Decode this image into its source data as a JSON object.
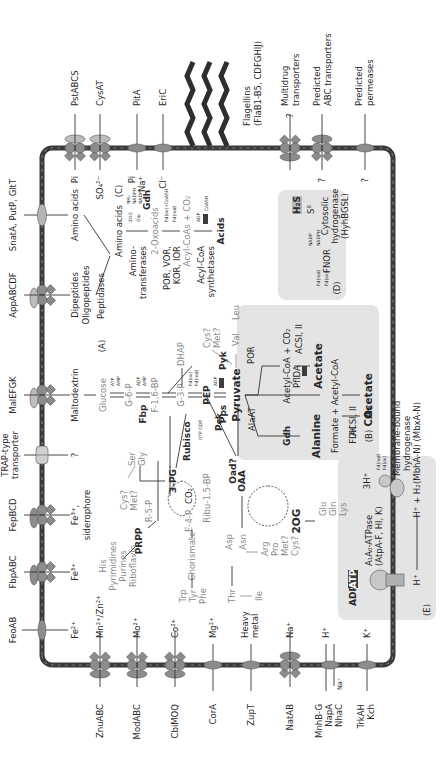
{
  "figure": {
    "orientation": "rotated-90-ccw",
    "membrane_color": "#3a3a3a",
    "box_color": "#e4e4e4",
    "transporter_color": "#8c8c8c"
  },
  "transporters_top": [
    {
      "name": "FeoAB",
      "substrate": "Fe2+",
      "type": "permease"
    },
    {
      "name": "FbpABC",
      "substrate": "Fe3+",
      "type": "abc"
    },
    {
      "name": "FepBCD",
      "substrate": "Fe3+, siderophore",
      "type": "abc"
    },
    {
      "name": "TRAP-type transporter",
      "substrate": "?",
      "type": "trap"
    },
    {
      "name": "MalEFGK",
      "substrate": "Maltodextrin",
      "type": "abc"
    },
    {
      "name": "AppABCDF",
      "substrate": "Dipeptides Oligopeptides",
      "type": "abc"
    },
    {
      "name": "SnatA, PutP, GltT",
      "substrate": "Amino acids",
      "type": "permease"
    }
  ],
  "transporters_right": [
    {
      "name": "PstABCS",
      "substrate": "Pi",
      "type": "abc"
    },
    {
      "name": "CysAT",
      "substrate": "SO4 2-",
      "type": "abc"
    },
    {
      "name": "PitA",
      "substrate": "Pi Na+",
      "type": "permease"
    },
    {
      "name": "EriC",
      "substrate": "Cl-",
      "type": "permease"
    },
    {
      "name": "Flagellins (FlaB1-B5, CDFGHIJ)",
      "type": "flagella"
    },
    {
      "name": "Multidrug transporters",
      "substrate": "?",
      "type": "abc"
    },
    {
      "name": "Predicted ABC transporters",
      "substrate": "?",
      "type": "abc"
    },
    {
      "name": "Predicted permeases",
      "substrate": "?",
      "type": "permease"
    }
  ],
  "transporters_bottom": [
    {
      "name": "ZnuABC",
      "substrate": "Mn2+/Zn2+",
      "type": "abc"
    },
    {
      "name": "ModABC",
      "substrate": "Mo2+",
      "type": "abc"
    },
    {
      "name": "CbiMOQ",
      "substrate": "Co2+",
      "type": "abc"
    },
    {
      "name": "CorA",
      "substrate": "Mg2+",
      "type": "permease"
    },
    {
      "name": "ZupT",
      "substrate": "Heavy metal",
      "type": "permease"
    },
    {
      "name": "NatAB",
      "substrate": "Na+",
      "type": "abc"
    },
    {
      "name": "MnhB-G NapA NhaC",
      "substrate": "H+ / Na+",
      "type": "antiporter"
    },
    {
      "name": "TrkAH Kch",
      "substrate": "K+",
      "type": "permease"
    }
  ],
  "labels": {
    "feoab": "FeoAB",
    "fbpabc": "FbpABC",
    "fepbcd": "FepBCD",
    "trap1": "TRAP-type",
    "trap2": "transporter",
    "malefgk": "MalEFGK",
    "appabcdf": "AppABCDF",
    "snata": "SnatA, PutP, GltT",
    "fe2": "Fe²⁺",
    "fe3a": "Fe³⁺",
    "fe3b": "Fe³⁺,",
    "siderophore": "siderophore",
    "q": "?",
    "maltodextrin": "Maltodextrin",
    "dipeptides": "Dipeptides",
    "oligopeptides": "Oligopeptides",
    "aminoacids_in": "Amino acids",
    "pstabcs": "PstABCS",
    "cysat": "CysAT",
    "pita": "PitA",
    "eric": "EriC",
    "flag1": "Flagellins",
    "flag2": "(FlaB1-B5, CDFGHIJ)",
    "multi1": "Multidrug",
    "multi2": "transporters",
    "predabc1": "Predicted",
    "predabc2": "ABC transporters",
    "predperm1": "Predicted",
    "predperm2": "permeases",
    "pi": "Pi",
    "so4": "SO₄²⁻",
    "pi2": "Pi",
    "na": "Na⁺",
    "cl": "Cl⁻",
    "znuabc": "ZnuABC",
    "modabc": "ModABC",
    "cbimoq": "CbiMOQ",
    "cora": "CorA",
    "zupt": "ZupT",
    "natab": "NatAB",
    "mnh1": "MnhB-G",
    "mnh2": "NapA",
    "mnh3": "NhaC",
    "trk1": "TrkAH",
    "trk2": "Kch",
    "mnzn": "Mn²⁺/Zn²⁺",
    "mo": "Mo²⁺",
    "co": "Co²⁺",
    "mg": "Mg²⁺",
    "heavy1": "Heavy",
    "heavy2": "metal",
    "na2": "Na⁺",
    "h": "H⁺",
    "na3": "Na⁺",
    "k": "K⁺",
    "secA": "(A)",
    "secB": "(B)",
    "secC": "(C)",
    "secD": "(D)",
    "secE": "(E)",
    "glucose": "Glucose",
    "g6p": "G-6-P",
    "fbp": "Fbp",
    "f16bp": "F-1,6-BP",
    "g3p": "G-3-P",
    "dhap": "DHAP",
    "pep": "PEP",
    "pps": "Pps",
    "pyk": "Pyk",
    "pyruvate": "Pyruvate",
    "pck": "Pck",
    "gtpgdp": "GTP GDP",
    "atp_s": "ATP",
    "adp_s": "ADP",
    "amp_s": "AMP",
    "fdox": "Fd(ox)",
    "fdred": "Fd(red)",
    "pg3": "3-PG",
    "rubisco": "Rubisco",
    "co2": "CO₂",
    "ribu": "Ribu-1,5-BP",
    "r5p": "R-5-P",
    "e4p": "E-4-P",
    "prpp": "PRPP",
    "chorismate": "Chorismate",
    "ser": "Ser",
    "gly": "Gly",
    "cys1": "Cys?",
    "met1": "Met?",
    "his": "His",
    "pyrimidines": "Pyrimidines",
    "purines": "Purines",
    "riboflavin": "Riboflavin",
    "trp": "Trp",
    "tyr": "Tyr",
    "phe": "Phe",
    "oaa": "OAA",
    "oad": "Oad?",
    "og2": "2OG",
    "glu": "Glu",
    "gln": "Gln",
    "lys": "Lys",
    "asp": "Asp",
    "asn": "Asn",
    "thr": "Thr",
    "ile": "Ile",
    "arg": "Arg",
    "pro": "Pro",
    "met2": "Met?",
    "cys2": "Cys?",
    "val": "Val",
    "leu": "Leu",
    "cys3": "Cys?",
    "met3": "Met?",
    "peptidases": "Peptidases",
    "aminoacids": "Amino acids",
    "amino1": "Amino-",
    "amino2": "transferases",
    "oxoacids": "2-Oxoacids",
    "gdh": "Gdh",
    "og2s": "2OG",
    "glus": "Glu",
    "nh4": "NH₄",
    "nadph": "NADPH",
    "nadp": "NADP",
    "por1": "POR, VOR,",
    "por2": "KOR, IOR",
    "fdoxcoa": "Fd(ox)+CoASH",
    "acylcoas": "Acyl-CoAs + CO₂",
    "acyl1": "Acyl-CoA",
    "acyl2": "synthetases",
    "coash": "CoASH",
    "acids": "Acids",
    "por": "POR",
    "acetylcoa": "Acetyl-CoA + CO₂",
    "acsi": "ACSI, II",
    "acetate1": "Acetate",
    "alaat": "AlaAT",
    "alanine": "Alanine",
    "pflda": "PflDA",
    "formate": "Formate + Acetyl-CoA",
    "acsi2": "ACSI, II",
    "acetate2": "Acetate",
    "fdh": "FDH",
    "co2b": "CO₂",
    "acc_ox": "Acceptor(ox)",
    "acc_red": "Acceptor(red)",
    "fnor": "FNOR",
    "h2s": "H₂S",
    "s0": "S⁰",
    "cyto1": "Cytosolic",
    "cyto2": "hydrogenase",
    "cyto3": "(HyhBGSL)",
    "atpase1": "A₁A₀-ATPase",
    "atpase2": "(AtpA-F, HI, K)",
    "adp_big": "ADP",
    "atp_big": "ATP",
    "hplus": "H⁺",
    "h3": "3H⁺",
    "hh2": "H⁺ + H₂",
    "mbh1": "Membrane-bound",
    "mbh2": "hydrogenase",
    "mbh3": "(MbhA-N) (MbxA-N)"
  }
}
